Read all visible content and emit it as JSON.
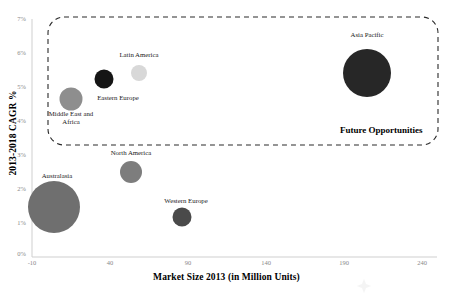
{
  "chart_data": {
    "type": "scatter",
    "title": "",
    "xlabel": "Market Size 2013 (in Million Units)",
    "ylabel": "2013-2018 CAGR %",
    "xlim": [
      -10,
      240
    ],
    "ylim": [
      0,
      7
    ],
    "xticks": [
      "-10",
      "40",
      "90",
      "140",
      "190",
      "240"
    ],
    "yticks": [
      "0%",
      "1%",
      "2%",
      "3%",
      "4%",
      "5%",
      "6%",
      "7%"
    ],
    "grid": false,
    "legend": "none",
    "bubbles": [
      {
        "label": "Asia Pacific",
        "x": 183,
        "y": 5.45,
        "size_radius_px": 24,
        "color": "#272727",
        "cx_px": 367,
        "cy_px": 73,
        "label_x_px": 367,
        "label_y_px": 35
      },
      {
        "label": "Latin America",
        "x": 59,
        "y": 5.45,
        "size_radius_px": 8,
        "color": "#d8d8d8",
        "cx_px": 139,
        "cy_px": 73,
        "label_x_px": 139,
        "label_y_px": 55
      },
      {
        "label": "Eastern Europe",
        "x": 36,
        "y": 5.25,
        "size_radius_px": 9.5,
        "color": "#151515",
        "cx_px": 104,
        "cy_px": 79,
        "label_x_px": 117,
        "label_y_px": 98
      },
      {
        "label": "Middle East and Africa",
        "x": 15,
        "y": 4.65,
        "size_radius_px": 11.5,
        "color": "#8e8e8e",
        "cx_px": 71,
        "cy_px": 99,
        "label_x_px": 71,
        "label_y_px": 114
      },
      {
        "label": "North America",
        "x": 63,
        "y": 2.5,
        "size_radius_px": 11,
        "color": "#7d7d7d",
        "cx_px": 131,
        "cy_px": 172,
        "label_x_px": 131,
        "label_y_px": 153
      },
      {
        "label": "Australasia",
        "x": 4,
        "y": 1.45,
        "size_radius_px": 26,
        "color": "#6f6f6f",
        "cx_px": 54,
        "cy_px": 207,
        "label_x_px": 57,
        "label_y_px": 176
      },
      {
        "label": "Western Europe",
        "x": 87,
        "y": 1.15,
        "size_radius_px": 9.5,
        "color": "#4a4a4a",
        "cx_px": 182,
        "cy_px": 217,
        "label_x_px": 186,
        "label_y_px": 201
      }
    ],
    "annotations": [
      {
        "label": "Future Opportunities",
        "type": "dashed-rounded-rect-zone",
        "x_px": 48,
        "y_px": 17,
        "w_px": 390,
        "h_px": 128,
        "label_x_px": 340,
        "label_y_px": 126
      }
    ],
    "axis_color": "#cfcfcf",
    "tick_text_color": "#8a8a8a",
    "zone_stroke_color": "#2a2a2a"
  }
}
